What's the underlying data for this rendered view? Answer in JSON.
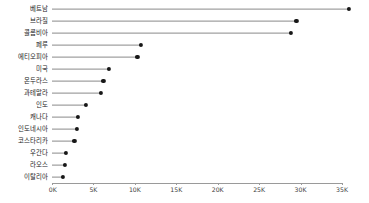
{
  "chart_data": {
    "type": "bar",
    "subtype": "lollipop-horizontal",
    "title": "",
    "subtitle": "",
    "xlabel": "",
    "ylabel": "",
    "xlim": [
      0,
      38300
    ],
    "grid": false,
    "legend": null,
    "orientation": "horizontal",
    "sorted": "descending",
    "categories": [
      "베트남",
      "브라질",
      "콜롬비아",
      "페루",
      "에티오피아",
      "미국",
      "온두라스",
      "과테말라",
      "인도",
      "캐나다",
      "인도네시아",
      "코스타리카",
      "우간다",
      "라오스",
      "이탈리아"
    ],
    "values": [
      35800,
      29500,
      28800,
      10700,
      10300,
      6900,
      6200,
      5900,
      4100,
      3100,
      3000,
      2700,
      1700,
      1600,
      1300
    ],
    "value_unit": "K",
    "xticks": [
      0,
      5000,
      10000,
      15000,
      20000,
      25000,
      30000,
      35000
    ],
    "xtick_labels": [
      "0K",
      "5K",
      "10K",
      "15K",
      "20K",
      "25K",
      "30K",
      "35K"
    ],
    "colors": {
      "dot": "#171717",
      "line": "#8a8a8a",
      "axis": "#9a9a9a",
      "label": "#1a1a1a",
      "tick_label": "#3d3d3d",
      "background": "#ffffff"
    }
  }
}
